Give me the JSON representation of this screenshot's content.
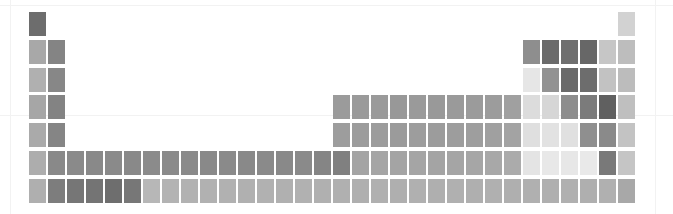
{
  "figure": {
    "title": "",
    "background_color": "#ffffff",
    "gridline_color": "#f2f2f2"
  },
  "axes": {
    "vertical_gridlines_x": [
      10,
      655
    ],
    "horizontal_gridlines_y": [
      5,
      115
    ]
  },
  "chart_data": {
    "type": "heatmap",
    "title": "",
    "subtitle": "",
    "xlabel": "",
    "ylabel": "",
    "grid": false,
    "legend_position": "none",
    "layout": {
      "columns": 32,
      "rows": 7,
      "origin_x": 29,
      "origin_y": 12,
      "cell_width": 17,
      "cell_height": 24,
      "col_pitch": 19.0,
      "row_pitch": 27.8
    },
    "colorscale": {
      "type": "sequential-gray",
      "low": "#f4f4f4",
      "high": "#5e5e5e"
    },
    "x": [
      1,
      2,
      3,
      4,
      5,
      6,
      7,
      8,
      9,
      10,
      11,
      12,
      13,
      14,
      15,
      16,
      17,
      18,
      19,
      20,
      21,
      22,
      23,
      24,
      25,
      26,
      27,
      28,
      29,
      30,
      31,
      32
    ],
    "y": [
      1,
      2,
      3,
      4,
      5,
      6,
      7
    ],
    "xlabel_text": "group (extended)",
    "ylabel_text": "period",
    "cells": [
      {
        "row": 1,
        "col": 1,
        "symbol": "H",
        "color": "#6d6d6d"
      },
      {
        "row": 1,
        "col": 32,
        "symbol": "He",
        "color": "#d2d2d2"
      },
      {
        "row": 2,
        "col": 1,
        "symbol": "Li",
        "color": "#a8a8a8"
      },
      {
        "row": 2,
        "col": 2,
        "symbol": "Be",
        "color": "#848484"
      },
      {
        "row": 2,
        "col": 27,
        "symbol": "B",
        "color": "#8e8e8e"
      },
      {
        "row": 2,
        "col": 28,
        "symbol": "C",
        "color": "#6b6b6b"
      },
      {
        "row": 2,
        "col": 29,
        "symbol": "N",
        "color": "#6f6f6f"
      },
      {
        "row": 2,
        "col": 30,
        "symbol": "O",
        "color": "#676767"
      },
      {
        "row": 2,
        "col": 31,
        "symbol": "F",
        "color": "#c6c6c6"
      },
      {
        "row": 2,
        "col": 32,
        "symbol": "Ne",
        "color": "#bdbdbd"
      },
      {
        "row": 3,
        "col": 1,
        "symbol": "Na",
        "color": "#b0b0b0"
      },
      {
        "row": 3,
        "col": 2,
        "symbol": "Mg",
        "color": "#878787"
      },
      {
        "row": 3,
        "col": 27,
        "symbol": "Al",
        "color": "#e6e6e6"
      },
      {
        "row": 3,
        "col": 28,
        "symbol": "Si",
        "color": "#929292"
      },
      {
        "row": 3,
        "col": 29,
        "symbol": "P",
        "color": "#6a6a6a"
      },
      {
        "row": 3,
        "col": 30,
        "symbol": "S",
        "color": "#6d6d6d"
      },
      {
        "row": 3,
        "col": 31,
        "symbol": "Cl",
        "color": "#c2c2c2"
      },
      {
        "row": 3,
        "col": 32,
        "symbol": "Ar",
        "color": "#bcbcbc"
      },
      {
        "row": 4,
        "col": 1,
        "symbol": "K",
        "color": "#a6a6a6"
      },
      {
        "row": 4,
        "col": 2,
        "symbol": "Ca",
        "color": "#838383"
      },
      {
        "row": 4,
        "col": 17,
        "symbol": "Sc",
        "color": "#9b9b9b"
      },
      {
        "row": 4,
        "col": 18,
        "symbol": "Ti",
        "color": "#9a9a9a"
      },
      {
        "row": 4,
        "col": 19,
        "symbol": "V",
        "color": "#9a9a9a"
      },
      {
        "row": 4,
        "col": 20,
        "symbol": "Cr",
        "color": "#989898"
      },
      {
        "row": 4,
        "col": 21,
        "symbol": "Mn",
        "color": "#9a9a9a"
      },
      {
        "row": 4,
        "col": 22,
        "symbol": "Fe",
        "color": "#999999"
      },
      {
        "row": 4,
        "col": 23,
        "symbol": "Co",
        "color": "#9a9a9a"
      },
      {
        "row": 4,
        "col": 24,
        "symbol": "Ni",
        "color": "#9b9b9b"
      },
      {
        "row": 4,
        "col": 25,
        "symbol": "Cu",
        "color": "#9c9c9c"
      },
      {
        "row": 4,
        "col": 26,
        "symbol": "Zn",
        "color": "#a0a0a0"
      },
      {
        "row": 4,
        "col": 27,
        "symbol": "Ga",
        "color": "#dcdcdc"
      },
      {
        "row": 4,
        "col": 28,
        "symbol": "Ge",
        "color": "#d6d6d6"
      },
      {
        "row": 4,
        "col": 29,
        "symbol": "As",
        "color": "#8d8d8d"
      },
      {
        "row": 4,
        "col": 30,
        "symbol": "Se",
        "color": "#7b7b7b"
      },
      {
        "row": 4,
        "col": 31,
        "symbol": "Br",
        "color": "#606060"
      },
      {
        "row": 4,
        "col": 32,
        "symbol": "Kr",
        "color": "#bfbfbf"
      },
      {
        "row": 5,
        "col": 1,
        "symbol": "Rb",
        "color": "#aaaaaa"
      },
      {
        "row": 5,
        "col": 2,
        "symbol": "Sr",
        "color": "#858585"
      },
      {
        "row": 5,
        "col": 17,
        "symbol": "Y",
        "color": "#9d9d9d"
      },
      {
        "row": 5,
        "col": 18,
        "symbol": "Zr",
        "color": "#9c9c9c"
      },
      {
        "row": 5,
        "col": 19,
        "symbol": "Nb",
        "color": "#9c9c9c"
      },
      {
        "row": 5,
        "col": 20,
        "symbol": "Mo",
        "color": "#9b9b9b"
      },
      {
        "row": 5,
        "col": 21,
        "symbol": "Tc",
        "color": "#9d9d9d"
      },
      {
        "row": 5,
        "col": 22,
        "symbol": "Ru",
        "color": "#9c9c9c"
      },
      {
        "row": 5,
        "col": 23,
        "symbol": "Rh",
        "color": "#9d9d9d"
      },
      {
        "row": 5,
        "col": 24,
        "symbol": "Pd",
        "color": "#9e9e9e"
      },
      {
        "row": 5,
        "col": 25,
        "symbol": "Ag",
        "color": "#a0a0a0"
      },
      {
        "row": 5,
        "col": 26,
        "symbol": "Cd",
        "color": "#a3a3a3"
      },
      {
        "row": 5,
        "col": 27,
        "symbol": "In",
        "color": "#dfdfdf"
      },
      {
        "row": 5,
        "col": 28,
        "symbol": "Sn",
        "color": "#e2e2e2"
      },
      {
        "row": 5,
        "col": 29,
        "symbol": "Sb",
        "color": "#e0e0e0"
      },
      {
        "row": 5,
        "col": 30,
        "symbol": "Te",
        "color": "#8f8f8f"
      },
      {
        "row": 5,
        "col": 31,
        "symbol": "I",
        "color": "#8a8a8a"
      },
      {
        "row": 5,
        "col": 32,
        "symbol": "Xe",
        "color": "#c3c3c3"
      },
      {
        "row": 6,
        "col": 1,
        "symbol": "Cs",
        "color": "#adadad"
      },
      {
        "row": 6,
        "col": 2,
        "symbol": "Ba",
        "color": "#898989"
      },
      {
        "row": 6,
        "col": 3,
        "symbol": "La",
        "color": "#8a8a8a"
      },
      {
        "row": 6,
        "col": 4,
        "symbol": "Ce",
        "color": "#898989"
      },
      {
        "row": 6,
        "col": 5,
        "symbol": "Pr",
        "color": "#8a8a8a"
      },
      {
        "row": 6,
        "col": 6,
        "symbol": "Nd",
        "color": "#898989"
      },
      {
        "row": 6,
        "col": 7,
        "symbol": "Pm",
        "color": "#8b8b8b"
      },
      {
        "row": 6,
        "col": 8,
        "symbol": "Sm",
        "color": "#8a8a8a"
      },
      {
        "row": 6,
        "col": 9,
        "symbol": "Eu",
        "color": "#8a8a8a"
      },
      {
        "row": 6,
        "col": 10,
        "symbol": "Gd",
        "color": "#898989"
      },
      {
        "row": 6,
        "col": 11,
        "symbol": "Tb",
        "color": "#8a8a8a"
      },
      {
        "row": 6,
        "col": 12,
        "symbol": "Dy",
        "color": "#898989"
      },
      {
        "row": 6,
        "col": 13,
        "symbol": "Ho",
        "color": "#8a8a8a"
      },
      {
        "row": 6,
        "col": 14,
        "symbol": "Er",
        "color": "#898989"
      },
      {
        "row": 6,
        "col": 15,
        "symbol": "Tm",
        "color": "#8a8a8a"
      },
      {
        "row": 6,
        "col": 16,
        "symbol": "Yb",
        "color": "#858585"
      },
      {
        "row": 6,
        "col": 17,
        "symbol": "Lu",
        "color": "#808080"
      },
      {
        "row": 6,
        "col": 18,
        "symbol": "Hf",
        "color": "#a4a4a4"
      },
      {
        "row": 6,
        "col": 19,
        "symbol": "Ta",
        "color": "#a5a5a5"
      },
      {
        "row": 6,
        "col": 20,
        "symbol": "W",
        "color": "#a4a4a4"
      },
      {
        "row": 6,
        "col": 21,
        "symbol": "Re",
        "color": "#a5a5a5"
      },
      {
        "row": 6,
        "col": 22,
        "symbol": "Os",
        "color": "#a4a4a4"
      },
      {
        "row": 6,
        "col": 23,
        "symbol": "Ir",
        "color": "#a5a5a5"
      },
      {
        "row": 6,
        "col": 24,
        "symbol": "Pt",
        "color": "#a6a6a6"
      },
      {
        "row": 6,
        "col": 25,
        "symbol": "Au",
        "color": "#a8a8a8"
      },
      {
        "row": 6,
        "col": 26,
        "symbol": "Hg",
        "color": "#ababab"
      },
      {
        "row": 6,
        "col": 27,
        "symbol": "Tl",
        "color": "#e4e4e4"
      },
      {
        "row": 6,
        "col": 28,
        "symbol": "Pb",
        "color": "#e8e8e8"
      },
      {
        "row": 6,
        "col": 29,
        "symbol": "Bi",
        "color": "#e7e7e7"
      },
      {
        "row": 6,
        "col": 30,
        "symbol": "Po",
        "color": "#e9e9e9"
      },
      {
        "row": 6,
        "col": 31,
        "symbol": "At",
        "color": "#797979"
      },
      {
        "row": 6,
        "col": 32,
        "symbol": "Rn",
        "color": "#c5c5c5"
      },
      {
        "row": 7,
        "col": 1,
        "symbol": "Fr",
        "color": "#afafaf"
      },
      {
        "row": 7,
        "col": 2,
        "symbol": "Ra",
        "color": "#7d7d7d"
      },
      {
        "row": 7,
        "col": 3,
        "symbol": "Ac",
        "color": "#767676"
      },
      {
        "row": 7,
        "col": 4,
        "symbol": "Th",
        "color": "#747474"
      },
      {
        "row": 7,
        "col": 5,
        "symbol": "Pa",
        "color": "#6e6e6e"
      },
      {
        "row": 7,
        "col": 6,
        "symbol": "U",
        "color": "#777777"
      },
      {
        "row": 7,
        "col": 7,
        "symbol": "Np",
        "color": "#b7b7b7"
      },
      {
        "row": 7,
        "col": 8,
        "symbol": "Pu",
        "color": "#b3b3b3"
      },
      {
        "row": 7,
        "col": 9,
        "symbol": "Am",
        "color": "#b2b2b2"
      },
      {
        "row": 7,
        "col": 10,
        "symbol": "Cm",
        "color": "#b1b1b1"
      },
      {
        "row": 7,
        "col": 11,
        "symbol": "Bk",
        "color": "#b1b1b1"
      },
      {
        "row": 7,
        "col": 12,
        "symbol": "Cf",
        "color": "#b0b0b0"
      },
      {
        "row": 7,
        "col": 13,
        "symbol": "Es",
        "color": "#b1b1b1"
      },
      {
        "row": 7,
        "col": 14,
        "symbol": "Fm",
        "color": "#b0b0b0"
      },
      {
        "row": 7,
        "col": 15,
        "symbol": "Md",
        "color": "#b1b1b1"
      },
      {
        "row": 7,
        "col": 16,
        "symbol": "No",
        "color": "#b0b0b0"
      },
      {
        "row": 7,
        "col": 17,
        "symbol": "Lr",
        "color": "#b0b0b0"
      },
      {
        "row": 7,
        "col": 18,
        "symbol": "Rf",
        "color": "#afafaf"
      },
      {
        "row": 7,
        "col": 19,
        "symbol": "Db",
        "color": "#b0b0b0"
      },
      {
        "row": 7,
        "col": 20,
        "symbol": "Sg",
        "color": "#afafaf"
      },
      {
        "row": 7,
        "col": 21,
        "symbol": "Bh",
        "color": "#b0b0b0"
      },
      {
        "row": 7,
        "col": 22,
        "symbol": "Hs",
        "color": "#afafaf"
      },
      {
        "row": 7,
        "col": 23,
        "symbol": "Mt",
        "color": "#b0b0b0"
      },
      {
        "row": 7,
        "col": 24,
        "symbol": "Ds",
        "color": "#afafaf"
      },
      {
        "row": 7,
        "col": 25,
        "symbol": "Rg",
        "color": "#b0b0b0"
      },
      {
        "row": 7,
        "col": 26,
        "symbol": "Cn",
        "color": "#afafaf"
      },
      {
        "row": 7,
        "col": 27,
        "symbol": "Nh",
        "color": "#b0b0b0"
      },
      {
        "row": 7,
        "col": 28,
        "symbol": "Fl",
        "color": "#afafaf"
      },
      {
        "row": 7,
        "col": 29,
        "symbol": "Mc",
        "color": "#b0b0b0"
      },
      {
        "row": 7,
        "col": 30,
        "symbol": "Lv",
        "color": "#afafaf"
      },
      {
        "row": 7,
        "col": 31,
        "symbol": "Ts",
        "color": "#b0b0b0"
      },
      {
        "row": 7,
        "col": 32,
        "symbol": "Og",
        "color": "#a8a8a8"
      }
    ]
  }
}
